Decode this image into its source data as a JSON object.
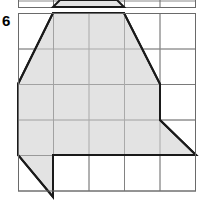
{
  "page": {
    "problem_number": "6",
    "background_color": "#ffffff"
  },
  "figure": {
    "name": "shaded-polygon-on-grid",
    "grid": {
      "origin_x": 18,
      "origin_y": 13,
      "cell_size": 35.5,
      "columns": 5,
      "rows": 5,
      "line_color": "#7a7a7a",
      "line_width": 1,
      "border_color": "#6a6a6a"
    },
    "shape": {
      "fill_color": "#e3e3e3",
      "stroke_color": "#1a1a1a",
      "stroke_width": 2,
      "points_px": "18,84 53,13 124,13 160,84 160,120 196,155 53,155 53,197 18,155",
      "vertices_grid": [
        [
          0,
          2
        ],
        [
          1,
          0
        ],
        [
          3,
          0
        ],
        [
          4,
          2
        ],
        [
          4,
          3
        ],
        [
          5,
          4
        ],
        [
          1,
          4
        ],
        [
          1,
          5.2
        ],
        [
          0,
          4
        ]
      ]
    },
    "partial_shape_above": {
      "fill_color": "#e3e3e3",
      "stroke_color": "#1a1a1a",
      "stroke_width": 2,
      "points_px": "53,7 60,0 117,0 124,7",
      "grid_line_y": 7,
      "grid_top_border_y": 0
    }
  }
}
